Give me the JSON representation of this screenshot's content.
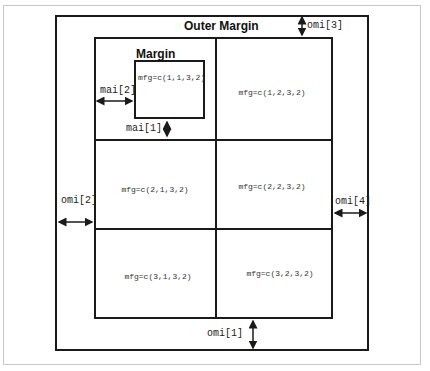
{
  "diagram": {
    "title": "Outer Margin",
    "margin_label": "Margin",
    "cells": [
      {
        "row": 1,
        "col": 1,
        "label": "mfg=c(1,1,3,2)"
      },
      {
        "row": 1,
        "col": 2,
        "label": "mfg=c(1,2,3,2)"
      },
      {
        "row": 2,
        "col": 1,
        "label": "mfg=c(2,1,3,2)"
      },
      {
        "row": 2,
        "col": 2,
        "label": "mfg=c(2,2,3,2)"
      },
      {
        "row": 3,
        "col": 1,
        "label": "mfg=c(3,1,3,2)"
      },
      {
        "row": 3,
        "col": 2,
        "label": "mfg=c(3,2,3,2)"
      }
    ],
    "annotations": {
      "mai2": "mai[2]",
      "mai1": "mai[1]",
      "omi1": "omi[1]",
      "omi2": "omi[2]",
      "omi3": "omi[3]",
      "omi4": "omi[4]"
    },
    "colors": {
      "line": "#1a1a1a",
      "text": "#333333",
      "frame": "#c8c8c8"
    }
  }
}
